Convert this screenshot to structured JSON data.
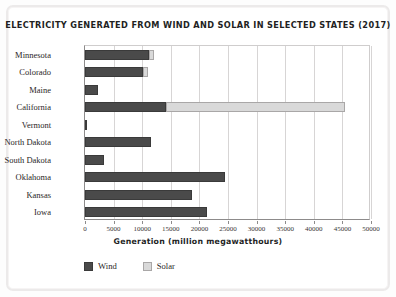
{
  "chart_data": {
    "type": "bar",
    "orientation": "horizontal",
    "stacked": true,
    "title": "ELECTRICITY GENERATED FROM WIND AND SOLAR IN SELECTED STATES (2017)",
    "xlabel": "Generation (million megawatthours)",
    "ylabel": "State",
    "xlim": [
      0,
      50000
    ],
    "xticks": [
      0,
      5000,
      10000,
      15000,
      20000,
      25000,
      30000,
      35000,
      40000,
      45000,
      50000
    ],
    "xtick_labels": [
      "0",
      "5000",
      "10000",
      "15000",
      "20000",
      "25000",
      "30000",
      "35000",
      "40000",
      "45000",
      "50000"
    ],
    "grid": true,
    "legend_position": "bottom-left",
    "categories": [
      "Minnesota",
      "Colorado",
      "Maine",
      "California",
      "Vermont",
      "North Dakota",
      "South Dakota",
      "Oklahoma",
      "Kansas",
      "Iowa"
    ],
    "series": [
      {
        "name": "Wind",
        "color": "#4a4a4a",
        "values": [
          11200,
          10150,
          2270,
          14200,
          350,
          11500,
          3300,
          24500,
          18700,
          21300
        ]
      },
      {
        "name": "Solar",
        "color": "#d9d9d9",
        "values": [
          800,
          900,
          0,
          31250,
          0,
          0,
          0,
          0,
          0,
          0
        ]
      }
    ]
  },
  "legend": {
    "items": [
      {
        "label": "Wind",
        "swatch": "wind"
      },
      {
        "label": "Solar",
        "swatch": "solar"
      }
    ]
  }
}
